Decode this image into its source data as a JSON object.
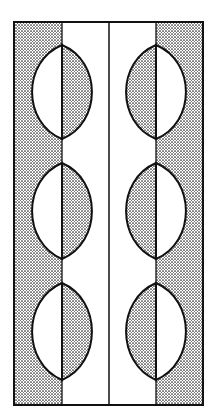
{
  "figure": {
    "title": "",
    "colors": {
      "ink": "#111111",
      "paper": "#ffffff",
      "stipple": "#222222"
    },
    "frame": {
      "x": 14,
      "y": 22,
      "width": 189,
      "height": 383
    },
    "dividers_x": [
      62,
      109,
      156
    ],
    "shaded_strips": [
      {
        "name": "left-outer-strip",
        "x": 14,
        "width": 48
      },
      {
        "name": "right-outer-strip",
        "x": 156,
        "width": 47
      }
    ],
    "lenses": {
      "left_column": {
        "axis_x": 62,
        "half_width": 30,
        "shaded_half": "right"
      },
      "right_column": {
        "axis_x": 156,
        "half_width": 30,
        "shaded_half": "left"
      },
      "rows": [
        {
          "top": 45,
          "bottom": 139
        },
        {
          "top": 163,
          "bottom": 259
        },
        {
          "top": 283,
          "bottom": 380
        }
      ]
    }
  }
}
